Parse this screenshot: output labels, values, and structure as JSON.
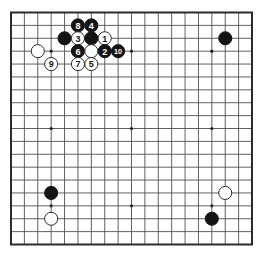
{
  "figure": {
    "type": "go-board-diagram",
    "board_size": 19,
    "colors": {
      "background": "#ffffff",
      "grid_line": "#4f4f4f",
      "border": "#2b2b2b",
      "black_stone": "#141414",
      "white_stone": "#ffffff",
      "white_stone_outline": "#2b2b2b",
      "black_stone_label": "#ffffff",
      "white_stone_label": "#141414",
      "star_point": "#1f1f1f"
    },
    "star_points": [
      [
        4,
        4
      ],
      [
        10,
        4
      ],
      [
        16,
        4
      ],
      [
        4,
        10
      ],
      [
        10,
        10
      ],
      [
        16,
        10
      ],
      [
        4,
        16
      ],
      [
        10,
        16
      ],
      [
        16,
        16
      ]
    ],
    "stones": [
      {
        "col": 6,
        "row": 2,
        "color": "black",
        "label": "8"
      },
      {
        "col": 7,
        "row": 2,
        "color": "black",
        "label": "4"
      },
      {
        "col": 5,
        "row": 3,
        "color": "black",
        "label": ""
      },
      {
        "col": 6,
        "row": 3,
        "color": "white",
        "label": "3"
      },
      {
        "col": 7,
        "row": 3,
        "color": "black",
        "label": ""
      },
      {
        "col": 8,
        "row": 3,
        "color": "white",
        "label": "1"
      },
      {
        "col": 17,
        "row": 3,
        "color": "black",
        "label": ""
      },
      {
        "col": 3,
        "row": 4,
        "color": "white",
        "label": ""
      },
      {
        "col": 6,
        "row": 4,
        "color": "black",
        "label": "6"
      },
      {
        "col": 7,
        "row": 4,
        "color": "white",
        "label": ""
      },
      {
        "col": 8,
        "row": 4,
        "color": "black",
        "label": "2"
      },
      {
        "col": 9,
        "row": 4,
        "color": "black",
        "label": "10"
      },
      {
        "col": 4,
        "row": 5,
        "color": "white",
        "label": "9"
      },
      {
        "col": 6,
        "row": 5,
        "color": "white",
        "label": "7"
      },
      {
        "col": 7,
        "row": 5,
        "color": "white",
        "label": "5"
      },
      {
        "col": 4,
        "row": 15,
        "color": "black",
        "label": ""
      },
      {
        "col": 17,
        "row": 15,
        "color": "white",
        "label": ""
      },
      {
        "col": 4,
        "row": 17,
        "color": "white",
        "label": ""
      },
      {
        "col": 16,
        "row": 17,
        "color": "black",
        "label": ""
      }
    ]
  }
}
